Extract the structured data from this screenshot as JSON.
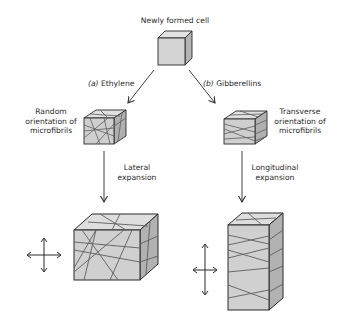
{
  "diagram": {
    "top": {
      "label": "Newly formed cell"
    },
    "branches": [
      {
        "id": "a",
        "prefix": "(a)",
        "treatment": "Ethylene",
        "orientation_label": [
          "Random",
          "orientation of",
          "microfibrils"
        ],
        "expansion_label": [
          "Lateral",
          "expansion"
        ],
        "result_shape": "wide cube with random microfibrils",
        "growth_icon": "four-way-arrows-equal"
      },
      {
        "id": "b",
        "prefix": "(b)",
        "treatment": "Gibberellins",
        "orientation_label": [
          "Transverse",
          "orientation of",
          "microfibrils"
        ],
        "expansion_label": [
          "Longitudinal",
          "expansion"
        ],
        "result_shape": "tall column with transverse microfibrils",
        "growth_icon": "four-way-arrows-vertical-elongated"
      }
    ],
    "colors": {
      "face_front": "#d4d4d4",
      "face_top": "#e2e2e2",
      "face_side": "#b4b4b4",
      "edge": "#2b2b2b",
      "fibril": "#6a6a6a",
      "arrow": "#2b2b2b"
    }
  }
}
